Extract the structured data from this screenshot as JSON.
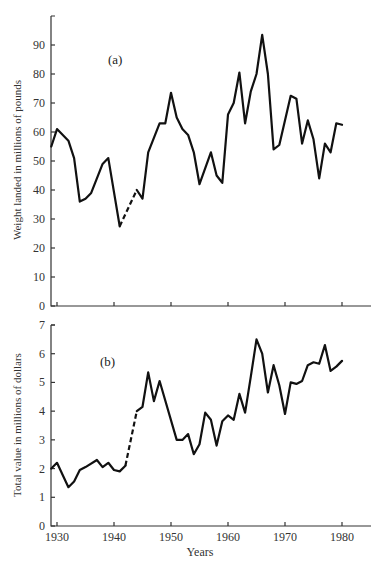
{
  "chart_data": [
    {
      "id": "a",
      "type": "line",
      "panel_label": "(a)",
      "title": "",
      "xlabel": "",
      "ylabel": "Weight landed in millions of pounds",
      "ylim": [
        0,
        100
      ],
      "xlim": [
        1929,
        1985
      ],
      "yticks": [
        0,
        10,
        20,
        30,
        40,
        50,
        60,
        70,
        80,
        90
      ],
      "xticks": [
        1930,
        1940,
        1950,
        1960,
        1970,
        1980
      ],
      "grid": false,
      "dashed_segment": [
        1941,
        1944
      ],
      "x": [
        1929,
        1930,
        1932,
        1933,
        1934,
        1935,
        1936,
        1938,
        1939,
        1941,
        1944,
        1945,
        1946,
        1948,
        1949,
        1950,
        1951,
        1952,
        1953,
        1954,
        1955,
        1957,
        1958,
        1959,
        1960,
        1961,
        1962,
        1963,
        1964,
        1965,
        1966,
        1967,
        1968,
        1969,
        1971,
        1972,
        1973,
        1974,
        1975,
        1976,
        1977,
        1978,
        1979,
        1980
      ],
      "values": [
        55,
        61,
        57,
        51,
        36,
        37,
        39,
        49,
        51,
        27.5,
        40,
        37,
        53,
        63,
        63,
        73.5,
        65,
        61,
        59,
        53,
        42,
        53,
        45,
        42.5,
        66,
        70,
        80.5,
        63,
        74,
        80,
        93.5,
        80,
        54,
        55.5,
        72.5,
        71.5,
        56,
        64,
        57.5,
        44,
        56,
        53,
        63,
        62.5
      ]
    },
    {
      "id": "b",
      "type": "line",
      "panel_label": "(b)",
      "title": "",
      "xlabel": "Years",
      "ylabel": "Total value in millions of dollars",
      "ylim": [
        0,
        7
      ],
      "xlim": [
        1929,
        1985
      ],
      "yticks": [
        0,
        1,
        2,
        3,
        4,
        5,
        6,
        7
      ],
      "xticks": [
        1930,
        1940,
        1950,
        1960,
        1970,
        1980
      ],
      "grid": false,
      "dashed_segment": [
        1942,
        1944
      ],
      "x": [
        1929,
        1930,
        1932,
        1933,
        1934,
        1935,
        1937,
        1938,
        1939,
        1940,
        1941,
        1942,
        1944,
        1945,
        1946,
        1947,
        1948,
        1951,
        1952,
        1953,
        1954,
        1955,
        1956,
        1957,
        1958,
        1959,
        1960,
        1961,
        1962,
        1963,
        1964,
        1965,
        1966,
        1967,
        1968,
        1969,
        1970,
        1971,
        1972,
        1973,
        1974,
        1975,
        1976,
        1977,
        1978,
        1979,
        1980
      ],
      "values": [
        2.0,
        2.2,
        1.35,
        1.55,
        1.95,
        2.05,
        2.3,
        2.05,
        2.2,
        1.95,
        1.9,
        2.1,
        4.0,
        4.15,
        5.35,
        4.35,
        5.05,
        3.0,
        3.0,
        3.2,
        2.5,
        2.85,
        3.95,
        3.7,
        2.8,
        3.65,
        3.85,
        3.7,
        4.6,
        3.95,
        5.2,
        6.5,
        6.0,
        4.65,
        5.6,
        4.9,
        3.9,
        5.0,
        4.95,
        5.05,
        5.6,
        5.7,
        5.65,
        6.3,
        5.4,
        5.55,
        5.75
      ]
    }
  ],
  "labels": {
    "panel_a": "(a)",
    "panel_b": "(b)",
    "ylabel_a": "Weight landed in millions of pounds",
    "ylabel_b": "Total value in millions of dollars",
    "xlabel": "Years",
    "xticks": [
      "1930",
      "1940",
      "1950",
      "1960",
      "1970",
      "1980"
    ],
    "yticks_a": [
      "0",
      "10",
      "20",
      "30",
      "40",
      "50",
      "60",
      "70",
      "80",
      "90"
    ],
    "yticks_b": [
      "0",
      "1",
      "2",
      "3",
      "4",
      "5",
      "6",
      "7"
    ]
  }
}
